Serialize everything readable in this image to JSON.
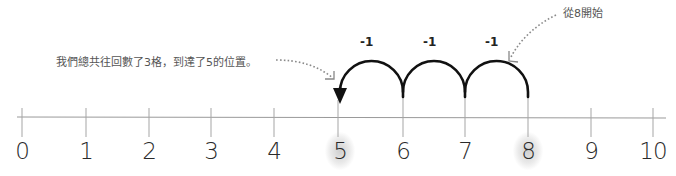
{
  "number_line": {
    "ticks": [
      {
        "label": "0",
        "x": 22,
        "highlight": false
      },
      {
        "label": "1",
        "x": 86,
        "highlight": false
      },
      {
        "label": "2",
        "x": 149,
        "highlight": false
      },
      {
        "label": "3",
        "x": 211,
        "highlight": false
      },
      {
        "label": "4",
        "x": 274,
        "highlight": false
      },
      {
        "label": "5",
        "x": 338,
        "highlight": true
      },
      {
        "label": "6",
        "x": 403,
        "highlight": false
      },
      {
        "label": "7",
        "x": 465,
        "highlight": false
      },
      {
        "label": "8",
        "x": 528,
        "highlight": true
      },
      {
        "label": "9",
        "x": 591,
        "highlight": false
      },
      {
        "label": "10",
        "x": 653,
        "highlight": false
      }
    ]
  },
  "jumps": [
    {
      "label": "-1",
      "from": 8,
      "to": 7
    },
    {
      "label": "-1",
      "from": 7,
      "to": 6
    },
    {
      "label": "-1",
      "from": 6,
      "to": 5
    }
  ],
  "step_labels": [
    "-1",
    "-1",
    "-1"
  ],
  "annotations": {
    "start": "從8開始",
    "result": "我們總共往回數了3格，到達了5的位置。"
  },
  "colors": {
    "arc": "#111111",
    "axis": "#9a9a9a",
    "tick": "#a0a0a0",
    "dotted_arrow": "#8a8a8a",
    "highlight_glow": "#9a9a9a"
  }
}
